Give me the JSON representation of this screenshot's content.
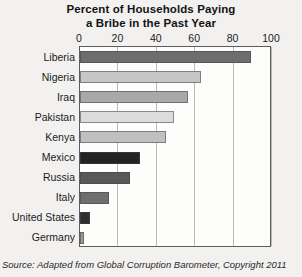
{
  "chart_data": {
    "type": "bar",
    "orientation": "horizontal",
    "title": "Percent of Households Paying a Bribe in the Past Year",
    "title_lines": [
      "Percent of Households Paying",
      "a Bribe in the Past Year"
    ],
    "xlabel": "",
    "ylabel": "",
    "xlim": [
      0,
      100
    ],
    "xticks": [
      0,
      20,
      40,
      60,
      80,
      100
    ],
    "xtick_labels": [
      "0",
      "20",
      "40",
      "60",
      "80",
      "100"
    ],
    "grid": true,
    "grid_axis": "x",
    "legend": false,
    "categories": [
      "Liberia",
      "Nigeria",
      "Iraq",
      "Pakistan",
      "Kenya",
      "Mexico",
      "Russia",
      "Italy",
      "United States",
      "Germany"
    ],
    "values": [
      89,
      63,
      56,
      49,
      45,
      31,
      26,
      15,
      5,
      2
    ],
    "bar_colors": [
      "#6d6d6d",
      "#c6c6c6",
      "#a9a9a9",
      "#dcdcdc",
      "#c0c0c0",
      "#232323",
      "#585858",
      "#6f6f6f",
      "#2e2e2e",
      "#9a9a9a"
    ],
    "bars": [
      {
        "category": "Liberia",
        "value": 89,
        "color": "#6d6d6d"
      },
      {
        "category": "Nigeria",
        "value": 63,
        "color": "#c6c6c6"
      },
      {
        "category": "Iraq",
        "value": 56,
        "color": "#a9a9a9"
      },
      {
        "category": "Pakistan",
        "value": 49,
        "color": "#dcdcdc"
      },
      {
        "category": "Kenya",
        "value": 45,
        "color": "#c0c0c0"
      },
      {
        "category": "Mexico",
        "value": 31,
        "color": "#232323"
      },
      {
        "category": "Russia",
        "value": 26,
        "color": "#585858"
      },
      {
        "category": "Italy",
        "value": 15,
        "color": "#6f6f6f"
      },
      {
        "category": "United States",
        "value": 5,
        "color": "#2e2e2e"
      },
      {
        "category": "Germany",
        "value": 2,
        "color": "#9a9a9a"
      }
    ]
  },
  "source": {
    "prefix": "Source: Adapted from ",
    "work": "Global Corruption Barometer",
    "suffix": ", Copyright 2011",
    "full": "Source: Adapted from Global Corruption Barometer, Copyright 2011"
  },
  "colors": {
    "page_background": "#f2f1ef",
    "plot_background": "#fdfdfc",
    "axis_line": "#5d5d5d",
    "gridline": "#b9b9b7",
    "text": "#1b1b1b"
  }
}
